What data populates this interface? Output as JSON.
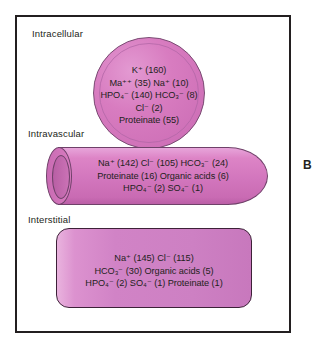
{
  "figure": {
    "panel_letter": "B",
    "border_color": "#231f20",
    "fill_color": "#d87cc0",
    "outline_color": "#6f4169",
    "background": "#ffffff"
  },
  "compartments": {
    "intracellular": {
      "label": "Intracellular",
      "shape": "circle",
      "lines": [
        "K⁺ (160)",
        "Ma⁺⁺ (35) Na⁺ (10)",
        "HPO₄⁻ (140) HCO₃⁻ (8)",
        "Cl⁻ (2)",
        "Proteinate (55)"
      ],
      "solutes": [
        {
          "name": "K",
          "charge": "+",
          "value": 160
        },
        {
          "name": "Ma",
          "charge": "++",
          "value": 35
        },
        {
          "name": "Na",
          "charge": "+",
          "value": 10
        },
        {
          "name": "HPO4",
          "charge": "-",
          "value": 140
        },
        {
          "name": "HCO3",
          "charge": "-",
          "value": 8
        },
        {
          "name": "Cl",
          "charge": "-",
          "value": 2
        },
        {
          "name": "Proteinate",
          "charge": "",
          "value": 55
        }
      ]
    },
    "intravascular": {
      "label": "Intravascular",
      "shape": "cylinder",
      "lines": [
        "Na⁺ (142) Cl⁻ (105) HCO₃⁻ (24)",
        "Proteinate (16) Organic acids (6)",
        "HPO₄⁻ (2) SO₄⁻ (1)"
      ],
      "solutes": [
        {
          "name": "Na",
          "charge": "+",
          "value": 142
        },
        {
          "name": "Cl",
          "charge": "-",
          "value": 105
        },
        {
          "name": "HCO3",
          "charge": "-",
          "value": 24
        },
        {
          "name": "Proteinate",
          "charge": "",
          "value": 16
        },
        {
          "name": "Organic acids",
          "charge": "",
          "value": 6
        },
        {
          "name": "HPO4",
          "charge": "-",
          "value": 2
        },
        {
          "name": "SO4",
          "charge": "-",
          "value": 1
        }
      ]
    },
    "interstitial": {
      "label": "Interstitial",
      "shape": "rounded-rectangle",
      "lines": [
        "Na⁺ (145) Cl⁻ (115)",
        "HCO₃⁻ (30) Organic acids (5)",
        "HPO₄⁻ (2) SO₄⁻ (1) Proteinate (1)"
      ],
      "solutes": [
        {
          "name": "Na",
          "charge": "+",
          "value": 145
        },
        {
          "name": "Cl",
          "charge": "-",
          "value": 115
        },
        {
          "name": "HCO3",
          "charge": "-",
          "value": 30
        },
        {
          "name": "Organic acids",
          "charge": "",
          "value": 5
        },
        {
          "name": "HPO4",
          "charge": "-",
          "value": 2
        },
        {
          "name": "SO4",
          "charge": "-",
          "value": 1
        },
        {
          "name": "Proteinate",
          "charge": "",
          "value": 1
        }
      ]
    }
  }
}
